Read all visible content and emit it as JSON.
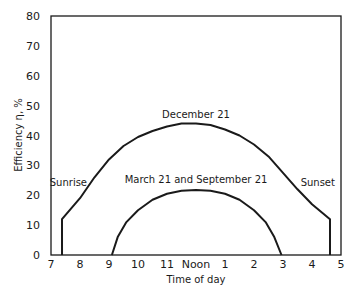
{
  "chart_data": {
    "type": "line",
    "title": "",
    "xlabel": "Time of day",
    "ylabel": "Efficiency η, %",
    "xlim": [
      7,
      17
    ],
    "ylim": [
      0,
      80
    ],
    "x_tick_labels": [
      "7",
      "8",
      "9",
      "10",
      "11",
      "Noon",
      "1",
      "2",
      "3",
      "4",
      "5"
    ],
    "x_tick_values": [
      7,
      8,
      9,
      10,
      11,
      12,
      13,
      14,
      15,
      16,
      17
    ],
    "y_ticks": [
      0,
      10,
      20,
      30,
      40,
      50,
      60,
      70,
      80
    ],
    "grid": false,
    "series": [
      {
        "name": "December 21",
        "x": [
          7.38,
          7.38,
          8.0,
          8.5,
          9.0,
          9.5,
          10.0,
          10.5,
          11.0,
          11.5,
          12.0,
          12.5,
          13.0,
          13.5,
          14.0,
          14.5,
          15.0,
          15.5,
          16.0,
          16.62,
          16.62
        ],
        "y": [
          0,
          12,
          19,
          26,
          32,
          36.5,
          39.5,
          41.5,
          43,
          44,
          44,
          43.5,
          42,
          40,
          37,
          33,
          27.5,
          22,
          17,
          12,
          0
        ]
      },
      {
        "name": "March 21 and September 21",
        "x": [
          9.1,
          9.3,
          9.6,
          10.0,
          10.5,
          11.0,
          11.5,
          12.0,
          12.5,
          13.0,
          13.5,
          14.0,
          14.4,
          14.7,
          14.95
        ],
        "y": [
          0,
          6,
          11,
          15,
          18.5,
          20.5,
          21.5,
          21.8,
          21.5,
          20.5,
          18.5,
          15,
          11,
          6,
          0
        ]
      }
    ],
    "annotations": [
      {
        "text": "December 21",
        "x": 12.0,
        "y": 46
      },
      {
        "text": "March 21 and September 21",
        "x": 12.0,
        "y": 24
      },
      {
        "text": "Sunrise",
        "x": 7.6,
        "y": 23
      },
      {
        "text": "Sunset",
        "x": 16.2,
        "y": 23
      }
    ]
  },
  "labels": {
    "xlabel": "Time of day",
    "ylabel": "Efficiency η, %",
    "dec": "December 21",
    "equinox": "March 21 and September 21",
    "sunrise": "Sunrise",
    "sunset": "Sunset"
  }
}
